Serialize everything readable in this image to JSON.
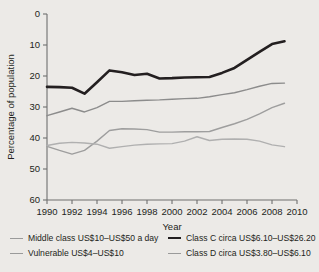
{
  "chart_data": {
    "type": "line",
    "title": "",
    "xlabel": "Year",
    "ylabel": "Percentage of population",
    "xlim": [
      1990,
      2010
    ],
    "ylim": [
      0,
      60
    ],
    "xticks": [
      1990,
      1992,
      1994,
      1996,
      1998,
      2000,
      2002,
      2004,
      2006,
      2008,
      2010
    ],
    "yticks": [
      0,
      10,
      20,
      30,
      40,
      50,
      60
    ],
    "grid": false,
    "legend_position": "bottom",
    "x": [
      1990,
      1991,
      1992,
      1993,
      1994,
      1995,
      1996,
      1997,
      1998,
      1999,
      2000,
      2001,
      2002,
      2003,
      2004,
      2005,
      2006,
      2007,
      2008,
      2009
    ],
    "series": [
      {
        "name": "Class C circa US$6.10–US$26.20",
        "color": "#231f20",
        "width": 2.6,
        "values": [
          36.5,
          36.4,
          36.2,
          34.3,
          38.0,
          41.8,
          41.2,
          40.3,
          40.7,
          39.2,
          39.3,
          39.5,
          39.6,
          39.7,
          41.0,
          42.6,
          45.2,
          47.8,
          50.3,
          51.2
        ]
      },
      {
        "name": "Middle class US$10–US$50 a day",
        "color": "#8c8c8c",
        "width": 1.4,
        "values": [
          27.2,
          28.4,
          29.6,
          28.4,
          29.8,
          31.8,
          31.8,
          32.0,
          32.2,
          32.3,
          32.5,
          32.7,
          32.8,
          33.3,
          34.0,
          34.6,
          35.6,
          36.7,
          37.6,
          37.7
        ]
      },
      {
        "name": "Vulnerable US$4–US$10",
        "color": "#9e9e9e",
        "width": 1.4,
        "values": [
          17.3,
          16.0,
          14.8,
          16.0,
          19.0,
          22.4,
          23.0,
          22.9,
          22.7,
          21.9,
          21.9,
          22.0,
          22.0,
          22.1,
          23.4,
          24.6,
          26.0,
          27.8,
          29.8,
          31.2
        ]
      },
      {
        "name": "Class D circa US$3.80–US$6.10",
        "color": "#b0b0b0",
        "width": 1.4,
        "values": [
          17.6,
          18.3,
          18.6,
          18.4,
          18.0,
          16.7,
          17.2,
          17.7,
          18.0,
          18.1,
          18.2,
          19.0,
          20.4,
          19.2,
          19.6,
          19.7,
          19.6,
          19.0,
          17.8,
          17.2
        ]
      }
    ]
  },
  "axis": {
    "y_title": "Percentage of population",
    "x_title": "Year",
    "y_labels": [
      "60",
      "50",
      "40",
      "30",
      "20",
      "10",
      "0"
    ],
    "x_labels": [
      "1990",
      "1992",
      "1994",
      "1996",
      "1998",
      "2000",
      "2002",
      "2004",
      "2006",
      "2008",
      "2010"
    ]
  },
  "legend": {
    "items": [
      {
        "label": "Middle class US$10–US$50 a day",
        "style": "thin"
      },
      {
        "label": "Vulnerable US$4–US$10",
        "style": "thin"
      },
      {
        "label": "Class C circa US$6.10–US$26.20",
        "style": "thick"
      },
      {
        "label": "Class D circa US$3.80–US$6.10",
        "style": "thin"
      }
    ]
  }
}
